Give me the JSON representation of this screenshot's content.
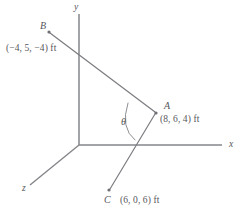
{
  "figure": {
    "units": "ft",
    "line_color": "#6e6f73",
    "text_color": "#55565a",
    "background": "#ffffff"
  },
  "axes": [
    {
      "name": "y-axis",
      "label": "y"
    },
    {
      "name": "x-axis",
      "label": "x"
    },
    {
      "name": "z-axis",
      "label": "z"
    }
  ],
  "axis_labels": {
    "x": "x",
    "y": "y",
    "z": "z"
  },
  "points": [
    {
      "id": "B",
      "label": "B",
      "coordinates": "(−4, 5, −4) ft",
      "x": -4,
      "y": 5,
      "z": -4,
      "px": 49,
      "py": 32
    },
    {
      "id": "A",
      "label": "A",
      "coordinates": "(8, 6, 4) ft",
      "x": 8,
      "y": 6,
      "z": 4,
      "px": 156,
      "py": 113
    },
    {
      "id": "C",
      "label": "C",
      "coordinates": "(6, 0, 6) ft",
      "x": 6,
      "y": 0,
      "z": 6,
      "px": 109,
      "py": 190
    }
  ],
  "angle": {
    "symbol": "θ",
    "vertex": "A",
    "between": [
      "AB",
      "AC"
    ]
  },
  "segments": [
    {
      "name": "segment-BA",
      "from": "B",
      "to": "A"
    },
    {
      "name": "segment-AC",
      "from": "A",
      "to": "C"
    }
  ]
}
